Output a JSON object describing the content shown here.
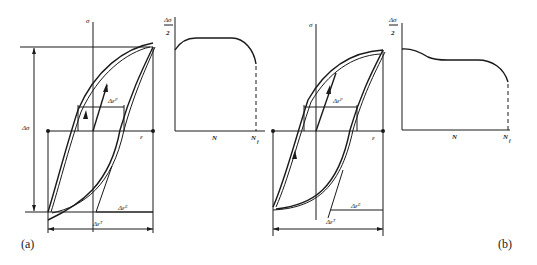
{
  "figure": {
    "panels": [
      {
        "id": "a",
        "label": "(a)",
        "hysteresis": {
          "axis_sigma": "σ",
          "axis_epsilon": "ε",
          "stress_range": "Δσ",
          "plastic_strain_range": "Δεᴾ",
          "elastic_strain_range": "Δεᴱ",
          "total_strain_range": "Δεᵀ"
        },
        "amplitude_plot": {
          "y_label_num": "Δσ",
          "y_label_den": "2",
          "x_label": "N",
          "x_end_label": "N",
          "x_end_sub": "f",
          "behavior": "cyclic hardening then stable, drop near failure"
        }
      },
      {
        "id": "b",
        "label": "(b)",
        "hysteresis": {
          "axis_sigma": "σ",
          "axis_epsilon": "ε",
          "plastic_strain_range": "Δεᴾ",
          "elastic_strain_range": "Δεᴱ",
          "total_strain_range": "Δεᵀ"
        },
        "amplitude_plot": {
          "y_label_num": "Δσ",
          "y_label_den": "2",
          "x_label": "N",
          "x_end_label": "N",
          "x_end_sub": "f",
          "behavior": "cyclic softening then stable, drop near failure"
        }
      }
    ]
  }
}
